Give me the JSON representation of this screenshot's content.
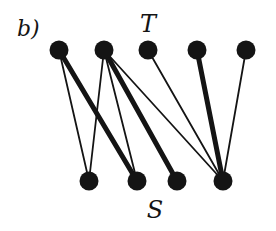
{
  "figure": {
    "panel_label": "b)",
    "top_set_label": "T",
    "bottom_set_label": "S"
  },
  "colors": {
    "ink": "#141414",
    "background": "#ffffff"
  },
  "graph": {
    "type": "bipartite",
    "top_nodes": [
      {
        "id": "t1",
        "x": 59,
        "y": 50
      },
      {
        "id": "t2",
        "x": 104,
        "y": 50
      },
      {
        "id": "t3",
        "x": 148,
        "y": 50
      },
      {
        "id": "t4",
        "x": 197,
        "y": 50
      },
      {
        "id": "t5",
        "x": 246,
        "y": 50
      }
    ],
    "bottom_nodes": [
      {
        "id": "s1",
        "x": 89,
        "y": 181
      },
      {
        "id": "s2",
        "x": 137,
        "y": 181
      },
      {
        "id": "s3",
        "x": 177,
        "y": 181
      },
      {
        "id": "s4",
        "x": 223,
        "y": 181
      }
    ],
    "edges": [
      {
        "from": "t1",
        "to": "s1",
        "weight": "thin"
      },
      {
        "from": "t1",
        "to": "s2",
        "weight": "thick"
      },
      {
        "from": "t2",
        "to": "s1",
        "weight": "thin"
      },
      {
        "from": "t2",
        "to": "s2",
        "weight": "thin"
      },
      {
        "from": "t2",
        "to": "s3",
        "weight": "thick"
      },
      {
        "from": "t2",
        "to": "s4",
        "weight": "thin"
      },
      {
        "from": "t3",
        "to": "s4",
        "weight": "thin"
      },
      {
        "from": "t4",
        "to": "s4",
        "weight": "thick"
      },
      {
        "from": "t5",
        "to": "s4",
        "weight": "thin"
      }
    ]
  }
}
